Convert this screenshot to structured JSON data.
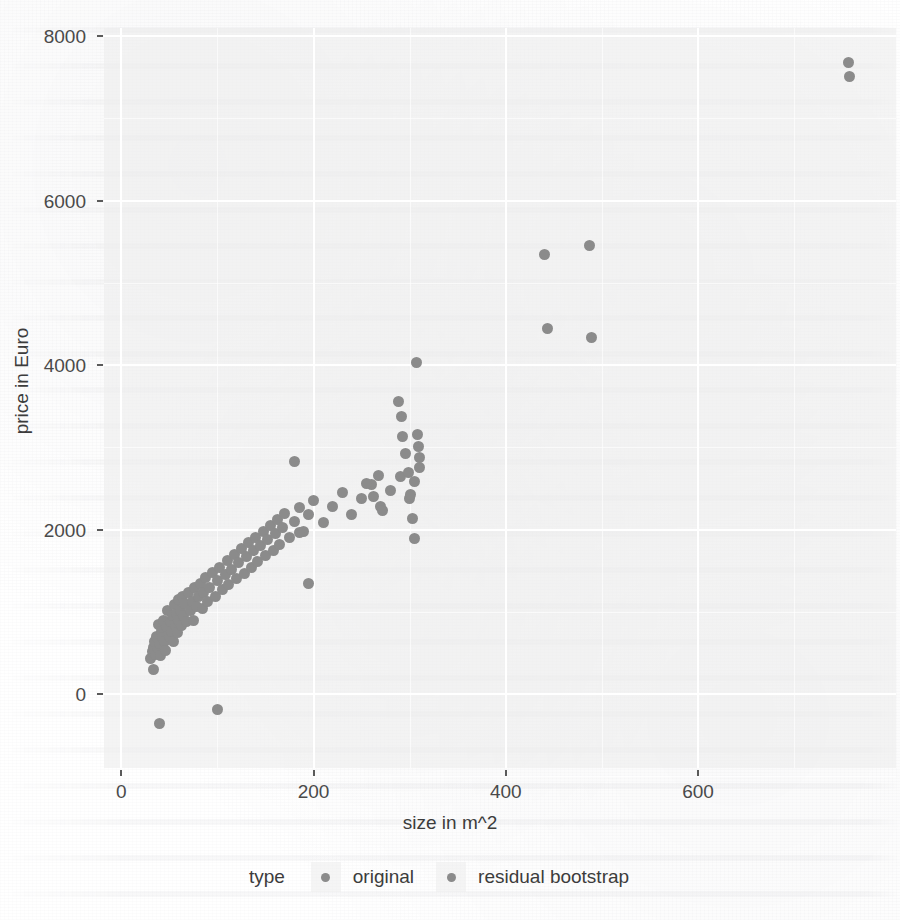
{
  "chart_data": {
    "type": "scatter",
    "title": "",
    "xlabel": "size in m^2",
    "ylabel": "price in Euro",
    "xlim": [
      -18,
      806
    ],
    "ylim": [
      -900,
      8100
    ],
    "xticks": [
      0,
      200,
      400,
      600
    ],
    "xtick_labels": [
      "0",
      "200",
      "400",
      "600"
    ],
    "yticks": [
      0,
      2000,
      4000,
      6000,
      8000
    ],
    "ytick_labels": [
      "0",
      "2000",
      "4000",
      "6000",
      "8000"
    ],
    "grid": true,
    "grid_minor": true,
    "legend_position": "bottom",
    "legend_title": "type",
    "point_color": "#8b8b8b",
    "panel_background": "#ebebeb",
    "gridline_color": "#ffffff",
    "series": [
      {
        "name": "original",
        "color": "#8b8b8b",
        "points": [
          [
            30,
            430
          ],
          [
            32,
            520
          ],
          [
            33,
            560
          ],
          [
            34,
            300
          ],
          [
            35,
            640
          ],
          [
            36,
            480
          ],
          [
            37,
            705
          ],
          [
            38,
            560
          ],
          [
            39,
            840
          ],
          [
            40,
            610
          ],
          [
            41,
            470
          ],
          [
            42,
            760
          ],
          [
            43,
            690
          ],
          [
            44,
            900
          ],
          [
            45,
            640
          ],
          [
            46,
            530
          ],
          [
            47,
            820
          ],
          [
            48,
            1010
          ],
          [
            50,
            700
          ],
          [
            51,
            880
          ],
          [
            52,
            760
          ],
          [
            53,
            960
          ],
          [
            54,
            640
          ],
          [
            55,
            1090
          ],
          [
            56,
            830
          ],
          [
            57,
            980
          ],
          [
            58,
            745
          ],
          [
            59,
            1150
          ],
          [
            60,
            900
          ],
          [
            62,
            1010
          ],
          [
            63,
            830
          ],
          [
            64,
            1180
          ],
          [
            65,
            960
          ],
          [
            66,
            1100
          ],
          [
            68,
            880
          ],
          [
            70,
            1240
          ],
          [
            72,
            1010
          ],
          [
            74,
            1130
          ],
          [
            75,
            900
          ],
          [
            76,
            1290
          ],
          [
            78,
            1060
          ],
          [
            80,
            1180
          ],
          [
            82,
            1350
          ],
          [
            84,
            1040
          ],
          [
            86,
            1230
          ],
          [
            88,
            1420
          ],
          [
            90,
            1120
          ],
          [
            92,
            1290
          ],
          [
            95,
            1480
          ],
          [
            98,
            1180
          ],
          [
            100,
            1380
          ],
          [
            102,
            1540
          ],
          [
            105,
            1270
          ],
          [
            108,
            1450
          ],
          [
            110,
            1620
          ],
          [
            112,
            1330
          ],
          [
            115,
            1520
          ],
          [
            118,
            1700
          ],
          [
            120,
            1400
          ],
          [
            122,
            1600
          ],
          [
            125,
            1770
          ],
          [
            128,
            1470
          ],
          [
            130,
            1670
          ],
          [
            132,
            1840
          ],
          [
            135,
            1540
          ],
          [
            138,
            1740
          ],
          [
            140,
            1900
          ],
          [
            142,
            1610
          ],
          [
            145,
            1810
          ],
          [
            148,
            1980
          ],
          [
            150,
            1680
          ],
          [
            152,
            1880
          ],
          [
            155,
            2050
          ],
          [
            158,
            1750
          ],
          [
            160,
            1950
          ],
          [
            162,
            2120
          ],
          [
            165,
            1820
          ],
          [
            168,
            2020
          ],
          [
            170,
            2190
          ],
          [
            175,
            1900
          ],
          [
            180,
            2100
          ],
          [
            185,
            2270
          ],
          [
            190,
            1980
          ],
          [
            195,
            2180
          ],
          [
            200,
            2350
          ],
          [
            210,
            2080
          ],
          [
            220,
            2280
          ],
          [
            230,
            2450
          ],
          [
            240,
            2180
          ],
          [
            250,
            2380
          ],
          [
            260,
            2550
          ],
          [
            270,
            2280
          ],
          [
            280,
            2480
          ],
          [
            290,
            2650
          ],
          [
            300,
            2380
          ],
          [
            305,
            2580
          ],
          [
            310,
            2750
          ]
        ]
      },
      {
        "name": "residual bootstrap",
        "color": "#8b8b8b",
        "points": [
          [
            40,
            -360
          ],
          [
            100,
            -190
          ],
          [
            180,
            2830
          ],
          [
            185,
            1960
          ],
          [
            195,
            1350
          ],
          [
            255,
            2560
          ],
          [
            262,
            2400
          ],
          [
            268,
            2660
          ],
          [
            272,
            2230
          ],
          [
            288,
            3560
          ],
          [
            291,
            3380
          ],
          [
            293,
            3130
          ],
          [
            296,
            2930
          ],
          [
            299,
            2700
          ],
          [
            301,
            2430
          ],
          [
            303,
            2140
          ],
          [
            305,
            1890
          ],
          [
            307,
            4030
          ],
          [
            308,
            3160
          ],
          [
            309,
            3010
          ],
          [
            310,
            2880
          ],
          [
            440,
            5340
          ],
          [
            443,
            4450
          ],
          [
            487,
            5450
          ],
          [
            489,
            4340
          ],
          [
            757,
            7680
          ],
          [
            758,
            7510
          ]
        ]
      }
    ]
  },
  "axis": {
    "x_title": "size in m^2",
    "y_title": "price in Euro",
    "x_tick_labels": [
      "0",
      "200",
      "400",
      "600"
    ],
    "y_tick_labels": [
      "8000",
      "6000",
      "4000",
      "2000",
      "0"
    ]
  },
  "legend": {
    "title": "type",
    "entries": [
      {
        "label": "original"
      },
      {
        "label": "residual bootstrap"
      }
    ]
  }
}
